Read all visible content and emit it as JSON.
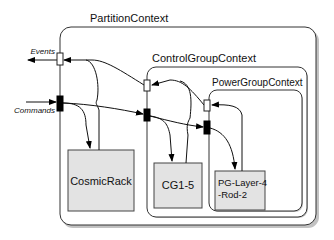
{
  "diagram": {
    "contexts": [
      {
        "id": "partition",
        "label": "PartitionContext"
      },
      {
        "id": "control",
        "label": "ControlGroupContext"
      },
      {
        "id": "power",
        "label": "PowerGroupContext"
      }
    ],
    "components": [
      {
        "id": "cosmicrack",
        "label": "CosmicRack"
      },
      {
        "id": "cg",
        "label": "CG1-5"
      },
      {
        "id": "pg",
        "label_line1": "PG-Layer-4",
        "label_line2": "-Rod-2"
      }
    ],
    "external_ports": {
      "events": "Events",
      "commands": "Commands"
    },
    "colors": {
      "component_fill": "#e3e3e3",
      "stroke": "#333333",
      "background": "#ffffff"
    }
  }
}
